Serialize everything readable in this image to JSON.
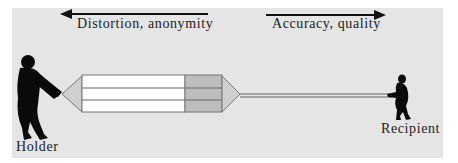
{
  "diagram": {
    "left_arrow": {
      "label": "Distortion, anonymity",
      "direction": "left",
      "icon": "arrow-left-icon"
    },
    "right_arrow": {
      "label": "Accuracy, quality",
      "direction": "right",
      "icon": "arrow-right-icon"
    },
    "holder": {
      "label": "Holder",
      "icon": "person-pulling-icon"
    },
    "recipient": {
      "label": "Recipient",
      "icon": "person-pulling-icon"
    },
    "rope": {
      "strands": 3,
      "segments": [
        {
          "name": "white-section",
          "color": "#ffffff"
        },
        {
          "name": "grey-section",
          "color": "#bdbdbd"
        }
      ]
    },
    "colors": {
      "background_panel": "#e5e5e5",
      "figure": "#0a0a0a",
      "cone": "#cfcfcf",
      "text": "#222222"
    }
  }
}
